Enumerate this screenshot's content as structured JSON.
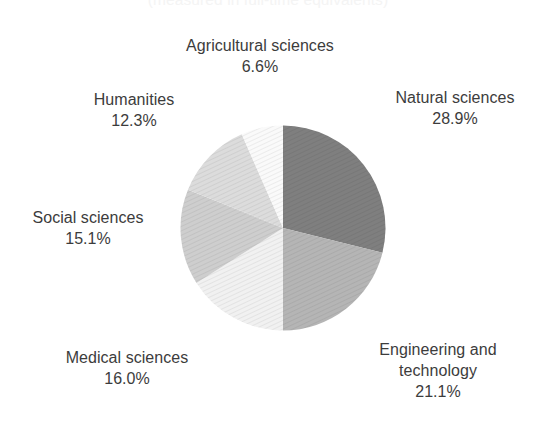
{
  "caption": {
    "text": "(measured in full-time equivalents)"
  },
  "chart_data": {
    "type": "pie",
    "title": "",
    "subtitle": "(measured in full-time equivalents)",
    "xlabel": "",
    "ylabel": "",
    "grid": false,
    "legend_position": "none",
    "start_angle_deg": 0,
    "direction": "clockwise",
    "units": "percent",
    "categories": [
      "Natural sciences",
      "Engineering and technology",
      "Medical sciences",
      "Social sciences",
      "Humanities",
      "Agricultural sciences"
    ],
    "values": [
      28.9,
      21.1,
      16.0,
      15.1,
      12.3,
      6.6
    ],
    "value_labels": [
      "28.9%",
      "21.1%",
      "16.0%",
      "15.1%",
      "12.3%",
      "6.6%"
    ],
    "colors": [
      "#7f7f7f",
      "#b5b5b5",
      "#f1f1f1",
      "#cecece",
      "#dcdcdc",
      "#fafafa"
    ],
    "texture": "diagonal-hatch",
    "total": 100.0
  },
  "slices": [
    {
      "id": "natural-sciences",
      "label": "Natural sciences",
      "percent_label": "28.9%",
      "value": 28.9,
      "color": "#7f7f7f"
    },
    {
      "id": "engineering-and-technology",
      "label_line1": "Engineering and",
      "label_line2": "technology",
      "label": "Engineering and technology",
      "percent_label": "21.1%",
      "value": 21.1,
      "color": "#b5b5b5"
    },
    {
      "id": "medical-sciences",
      "label": "Medical sciences",
      "percent_label": "16.0%",
      "value": 16.0,
      "color": "#f1f1f1"
    },
    {
      "id": "social-sciences",
      "label": "Social sciences",
      "percent_label": "15.1%",
      "value": 15.1,
      "color": "#cecece"
    },
    {
      "id": "humanities",
      "label": "Humanities",
      "percent_label": "12.3%",
      "value": 12.3,
      "color": "#dcdcdc"
    },
    {
      "id": "agricultural-sciences",
      "label": "Agricultural sciences",
      "percent_label": "6.6%",
      "value": 6.6,
      "color": "#fafafa"
    }
  ]
}
